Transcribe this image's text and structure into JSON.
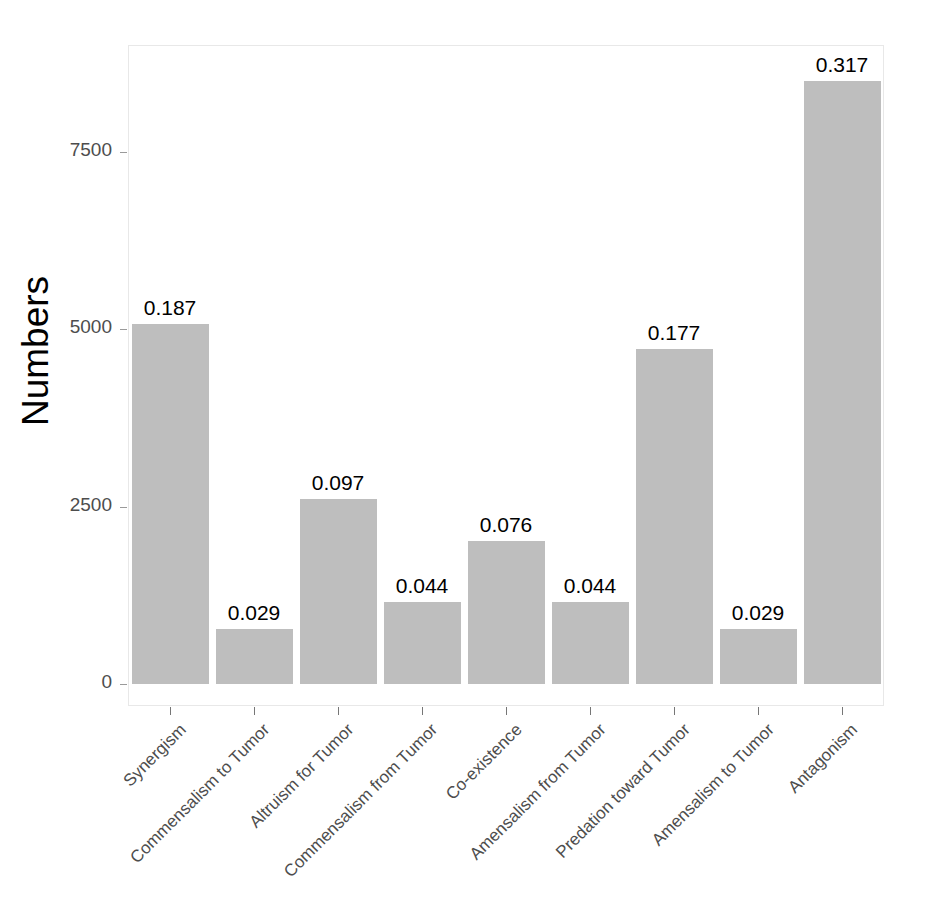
{
  "chart_data": {
    "type": "bar",
    "title": "",
    "subtitle": "",
    "xlabel": "",
    "ylabel": "Numbers",
    "ylim": [
      0,
      8800
    ],
    "grid": false,
    "legend": "none",
    "y_ticks": [
      0,
      2500,
      5000,
      7500
    ],
    "y_tick_labels": [
      "0",
      "2500",
      "5000",
      "7500"
    ],
    "categories": [
      "Synergism",
      "Commensalism to Tumor",
      "Altruism for Tumor",
      "Commensalism from Tumor",
      "Co-existence",
      "Amensalism from Tumor",
      "Predation toward Tumor",
      "Amensalism to Tumor",
      "Antagonism"
    ],
    "values": [
      5077,
      777,
      2610,
      1160,
      2015,
      1160,
      4723,
      777,
      8500
    ],
    "data_labels": [
      "0.187",
      "0.029",
      "0.097",
      "0.044",
      "0.076",
      "0.044",
      "0.177",
      "0.029",
      "0.317"
    ],
    "bar_color": "#bebebe",
    "bar_label_color": "#000000",
    "axis_text_color": "#4d4d4d",
    "panel_border_color": "#e8e8e8"
  }
}
